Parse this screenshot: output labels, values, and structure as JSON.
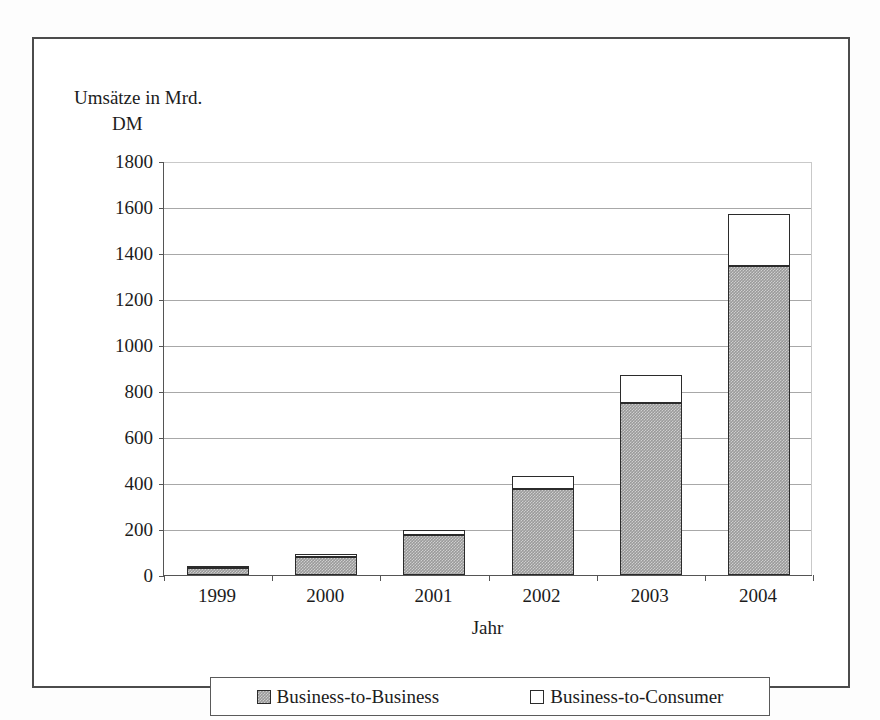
{
  "chart_data": {
    "type": "bar",
    "subtype": "stacked",
    "title": "",
    "categories": [
      "1999",
      "2000",
      "2001",
      "2002",
      "2003",
      "2004"
    ],
    "series": [
      {
        "name": "Business-to-Business",
        "color": "#9a9a9a",
        "values": [
          30,
          80,
          175,
          375,
          750,
          1345
        ]
      },
      {
        "name": "Business-to-Consumer",
        "color": "#ffffff",
        "values": [
          5,
          10,
          20,
          55,
          120,
          225
        ]
      }
    ],
    "totals": [
      35,
      90,
      195,
      430,
      870,
      1570
    ],
    "xlabel": "Jahr",
    "ylabel": "Umsätze in Mrd. DM",
    "ylabel_line1": "Umsätze in Mrd.",
    "ylabel_line2": "DM",
    "ylim": [
      0,
      1800
    ],
    "ytick_step": 200,
    "yticks": [
      0,
      200,
      400,
      600,
      800,
      1000,
      1200,
      1400,
      1600,
      1800
    ],
    "ytick_labels": [
      "0",
      "200",
      "400",
      "600",
      "800",
      "1000",
      "1200",
      "1400",
      "1600",
      "1800"
    ],
    "grid": true,
    "grid_axis": "y",
    "legend_position": "bottom",
    "legend_entries": [
      "Business-to-Business",
      "Business-to-Consumer"
    ]
  }
}
